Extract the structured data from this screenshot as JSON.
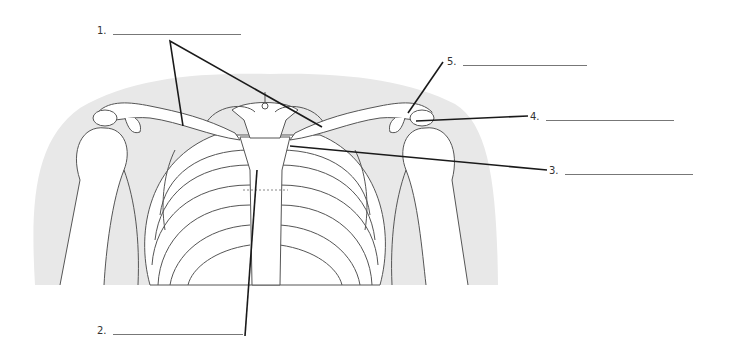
{
  "diagram": {
    "labels": [
      {
        "id": 1,
        "text": "1.",
        "answer": "",
        "x": 97,
        "y": 25,
        "blank_width": 128
      },
      {
        "id": 2,
        "text": "2.",
        "answer": "",
        "x": 97,
        "y": 325,
        "blank_width": 130
      },
      {
        "id": 3,
        "text": "3.",
        "answer": "",
        "x": 549,
        "y": 165,
        "blank_width": 128
      },
      {
        "id": 4,
        "text": "4.",
        "answer": "",
        "x": 530,
        "y": 111,
        "blank_width": 128
      },
      {
        "id": 5,
        "text": "5.",
        "answer": "",
        "x": 447,
        "y": 56,
        "blank_width": 124
      }
    ],
    "colors": {
      "background_shadow": "#e6e6e6",
      "bone_fill": "#ffffff",
      "bone_outline": "#555555",
      "leader_line": "#1a1a1a",
      "blank_line": "#777777"
    }
  }
}
